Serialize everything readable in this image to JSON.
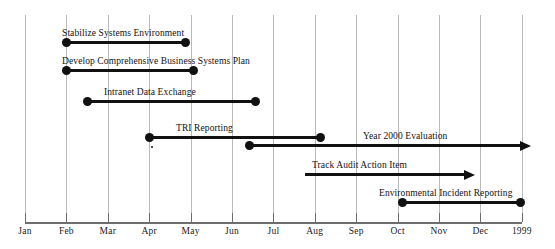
{
  "chart_data": {
    "type": "gantt",
    "title": "",
    "xlabel": "",
    "ylabel": "",
    "grid": true,
    "legend": "none",
    "axis": {
      "tick_labels": [
        "Jan",
        "Feb",
        "Mar",
        "Apr",
        "May",
        "Jun",
        "Jul",
        "Aug",
        "Sep",
        "Oct",
        "Nov",
        "Dec",
        "1999"
      ],
      "tick_count": 13,
      "x_start_px": 25,
      "x_end_px": 522,
      "tick_spacing_px": 41.4,
      "axis_color": "#6d6d6d",
      "grid_color": "#b9b9b9"
    },
    "bar_color": "#111111",
    "tasks": [
      {
        "label": "Stabilize Systems Environment",
        "start": "Feb",
        "end": "Apr-mid",
        "start_px": 66,
        "end_px": 186,
        "row_y_px": 41,
        "label_x_px": 62,
        "start_marker": "dot",
        "end_marker": "dot"
      },
      {
        "label": "Develop Comprehensive Business Systems Plan",
        "start": "Feb",
        "end": "May",
        "start_px": 66,
        "end_px": 194,
        "row_y_px": 69,
        "label_x_px": 62,
        "start_marker": "dot",
        "end_marker": "dot"
      },
      {
        "label": "Intranet Data Exchange",
        "start": "Mar-mid",
        "end": "Jun-late",
        "start_px": 87,
        "end_px": 256,
        "row_y_px": 100,
        "label_x_px": 104,
        "start_marker": "dot",
        "end_marker": "dot"
      },
      {
        "label": "TRI Reporting",
        "start": "Apr",
        "end": "Aug",
        "start_px": 149,
        "end_px": 321,
        "row_y_px": 136,
        "label_x_px": 176,
        "start_marker": "dot",
        "end_marker": "dot"
      },
      {
        "label": "Year 2000 Evaluation",
        "start": "Jun-mid",
        "end": "1999",
        "start_px": 249,
        "end_px": 520,
        "row_y_px": 144,
        "label_x_px": 363,
        "start_marker": "dot",
        "end_marker": "arrow"
      },
      {
        "label": "Track Audit Action Item",
        "start": "Jul-mid",
        "end": "Nov",
        "start_px": 305,
        "end_px": 464,
        "row_y_px": 173,
        "label_x_px": 312,
        "start_marker": "none",
        "end_marker": "arrow"
      },
      {
        "label": "Environmental Incident Reporting",
        "start": "Sep",
        "end": "1999",
        "start_px": 402,
        "end_px": 521,
        "row_y_px": 201,
        "label_x_px": 379,
        "start_marker": "dot",
        "end_marker": "dot"
      }
    ]
  }
}
